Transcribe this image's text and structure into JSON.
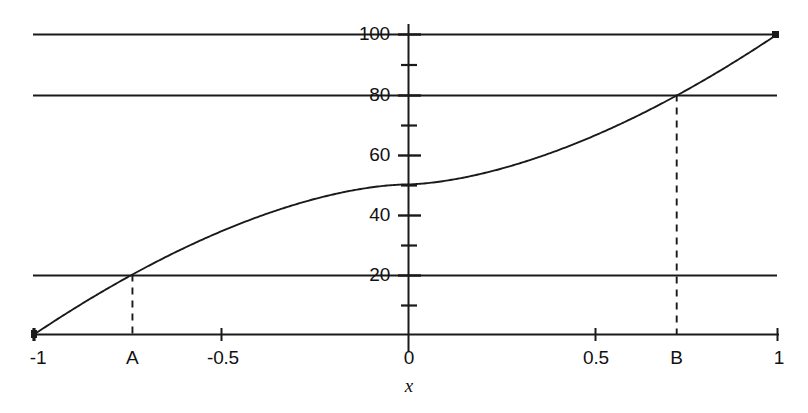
{
  "chart_data": {
    "type": "line",
    "title": "",
    "subtitle": "",
    "xlabel": "x",
    "ylabel": "",
    "xlim": [
      -1,
      1
    ],
    "ylim": [
      0,
      110
    ],
    "grid": true,
    "legend": null,
    "x_ticks": [
      {
        "value": -1,
        "label": "-1"
      },
      {
        "value": -0.5,
        "label": "-0.5"
      },
      {
        "value": 0,
        "label": "0"
      },
      {
        "value": 0.5,
        "label": "0.5"
      },
      {
        "value": 1,
        "label": "1"
      }
    ],
    "y_ticks_major": [
      {
        "value": 20,
        "label": "20"
      },
      {
        "value": 40,
        "label": "40"
      },
      {
        "value": 60,
        "label": "60"
      },
      {
        "value": 80,
        "label": "80"
      },
      {
        "value": 100,
        "label": "100"
      }
    ],
    "y_ticks_minor": [
      10,
      30,
      50,
      70,
      90
    ],
    "gridlines_y": [
      20,
      80,
      100
    ],
    "series": [
      {
        "name": "curve",
        "x": [
          -1.0,
          -0.95,
          -0.9,
          -0.85,
          -0.8,
          -0.75,
          -0.7,
          -0.65,
          -0.6,
          -0.55,
          -0.5,
          -0.45,
          -0.4,
          -0.35,
          -0.3,
          -0.25,
          -0.2,
          -0.15,
          -0.1,
          -0.05,
          0.0,
          0.05,
          0.1,
          0.15,
          0.2,
          0.25,
          0.3,
          0.35,
          0.4,
          0.45,
          0.5,
          0.55,
          0.6,
          0.65,
          0.7,
          0.75,
          0.8,
          0.85,
          0.9,
          0.95,
          1.0
        ],
        "values": [
          0.0,
          4.4,
          8.6,
          12.6,
          16.5,
          20.2,
          23.8,
          27.2,
          30.5,
          33.6,
          36.6,
          39.4,
          42.0,
          44.4,
          46.6,
          48.5,
          50.1,
          51.4,
          52.4,
          53.0,
          50.0,
          47.0,
          47.6,
          48.6,
          49.9,
          51.5,
          53.4,
          55.6,
          58.0,
          60.6,
          63.4,
          66.4,
          69.5,
          72.8,
          76.2,
          79.8,
          83.5,
          87.4,
          91.4,
          95.6,
          100.0
        ]
      }
    ],
    "annotations": [
      {
        "name": "A",
        "label": "A",
        "x": -0.735,
        "y": 20,
        "dashed_guide": true
      },
      {
        "name": "B",
        "label": "B",
        "x": 0.73,
        "y": 80,
        "dashed_guide": true
      }
    ]
  },
  "axis_title": {
    "x": "x"
  }
}
